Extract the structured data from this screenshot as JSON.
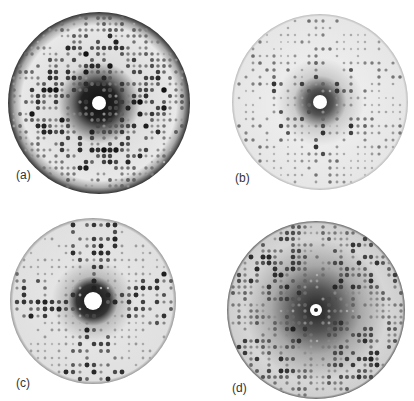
{
  "figure": {
    "panels": [
      {
        "id": "a",
        "label": "(a)",
        "cx": 99,
        "cy": 103,
        "r": 91,
        "hole_r": 7,
        "label_x": 16,
        "label_y": 168,
        "style": "dense-dark-rim"
      },
      {
        "id": "b",
        "label": "(b)",
        "cx": 320,
        "cy": 102,
        "r": 88,
        "hole_r": 7,
        "label_x": 235,
        "label_y": 171,
        "style": "sparse-spots"
      },
      {
        "id": "c",
        "label": "(c)",
        "cx": 93,
        "cy": 301,
        "r": 83,
        "hole_r": 9,
        "label_x": 16,
        "label_y": 376,
        "style": "cross-clusters"
      },
      {
        "id": "d",
        "label": "(d)",
        "cx": 316,
        "cy": 310,
        "r": 89,
        "hole_r": 6,
        "label_x": 232,
        "label_y": 381,
        "style": "diagonal-lattice"
      }
    ]
  }
}
